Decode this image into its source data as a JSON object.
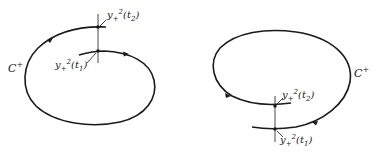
{
  "diagrams": [
    {
      "id": "left",
      "curve_label": "C",
      "curve_label_sup": "+",
      "points": [
        {
          "name": "y",
          "sub": "+",
          "sup": "2",
          "arg": "t",
          "arg_sub": "2",
          "label": "y+²(t₂)"
        },
        {
          "name": "y",
          "sub": "+",
          "sup": "2",
          "arg": "t",
          "arg_sub": "1",
          "label": "y+²(t₁)"
        }
      ]
    },
    {
      "id": "right",
      "curve_label": "C",
      "curve_label_sup": "+",
      "points": [
        {
          "name": "y",
          "sub": "+",
          "sup": "2",
          "arg": "t",
          "arg_sub": "2",
          "label": "y+²(t₂)"
        },
        {
          "name": "y",
          "sub": "+",
          "sup": "2",
          "arg": "t",
          "arg_sub": "1",
          "label": "y+²(t₁)"
        }
      ]
    }
  ],
  "colors": {
    "line": "#1a1a1a",
    "background": "#ffffff"
  }
}
